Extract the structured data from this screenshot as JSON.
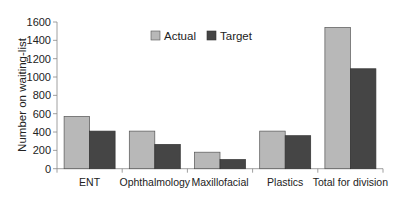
{
  "chart_data": {
    "type": "bar",
    "title": "",
    "xlabel": "",
    "ylabel": "Number on waiting-list",
    "ylim": [
      0,
      1600
    ],
    "yticks": [
      0,
      200,
      400,
      600,
      800,
      1000,
      1200,
      1400,
      1600
    ],
    "grid": false,
    "legend_position": "top-center (inside plot)",
    "categories": [
      "ENT",
      "Ophthalmology",
      "Maxillofacial",
      "Plastics",
      "Total for division"
    ],
    "series": [
      {
        "name": "Actual",
        "color": "#b8b8b8",
        "values": [
          570,
          410,
          180,
          410,
          1540
        ]
      },
      {
        "name": "Target",
        "color": "#454545",
        "values": [
          410,
          265,
          100,
          360,
          1090
        ]
      }
    ]
  },
  "legend": {
    "items": [
      {
        "label": "Actual",
        "color": "#b8b8b8"
      },
      {
        "label": "Target",
        "color": "#454545"
      }
    ]
  },
  "axis": {
    "ylabel": "Number on waiting-list"
  }
}
